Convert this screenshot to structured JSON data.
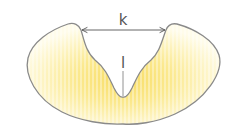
{
  "diagram": {
    "shape": "crescent-cross-section",
    "labels": {
      "width_label": "k",
      "depth_label": "l"
    },
    "colors": {
      "outline": "#8a8a8a",
      "fill_light": "#fffbe0",
      "fill_dark": "#f9e27a",
      "stripe": "#fff7c8",
      "arrow": "#555555",
      "text": "#555555"
    }
  }
}
